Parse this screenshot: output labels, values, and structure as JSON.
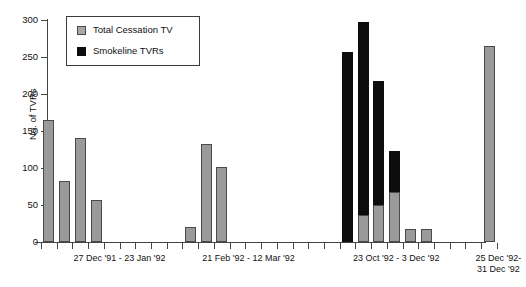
{
  "chart_data": {
    "type": "bar",
    "title": "",
    "subtitle": "",
    "xlabel": "",
    "ylabel": "No. of TVRs",
    "ylim": [
      0,
      300
    ],
    "yticks": [
      0,
      50,
      100,
      150,
      200,
      250,
      300
    ],
    "grid": false,
    "stacked": true,
    "legend_position": "top-left",
    "legend": [
      "Total Cessation TV",
      "Smokeline TVRs"
    ],
    "colors": {
      "total_cessation_tv": "#9a9a9a",
      "smokeline_tvrs": "#0d0d0d",
      "axis": "#444444",
      "background": "#ffffff"
    },
    "x_slot_count": 29,
    "x_group_labels": [
      "27 Dec '91 - 23 Jan '92",
      "21 Feb '92 - 12 Mar '92",
      "23 Oct '92 - 3 Dec '92",
      "25 Dec '92-\n31 Dec '92"
    ],
    "series": [
      {
        "name": "Total Cessation TV",
        "values": [
          165,
          82,
          141,
          57,
          0,
          0,
          0,
          0,
          0,
          20,
          133,
          101,
          0,
          0,
          0,
          0,
          0,
          0,
          0,
          0,
          37,
          50,
          67,
          18,
          17,
          0,
          0,
          0,
          265
        ]
      },
      {
        "name": "Smokeline TVRs",
        "values": [
          0,
          0,
          0,
          0,
          0,
          0,
          0,
          0,
          0,
          0,
          0,
          0,
          0,
          0,
          0,
          0,
          0,
          0,
          0,
          257,
          260,
          168,
          56,
          0,
          0,
          0,
          0,
          0,
          0
        ]
      }
    ],
    "bars": [
      {
        "slot": 0,
        "gray": 165,
        "black": 0,
        "total": 165
      },
      {
        "slot": 1,
        "gray": 82,
        "black": 0,
        "total": 82
      },
      {
        "slot": 2,
        "gray": 141,
        "black": 0,
        "total": 141
      },
      {
        "slot": 3,
        "gray": 57,
        "black": 0,
        "total": 57
      },
      {
        "slot": 9,
        "gray": 20,
        "black": 0,
        "total": 20
      },
      {
        "slot": 10,
        "gray": 133,
        "black": 0,
        "total": 133
      },
      {
        "slot": 11,
        "gray": 101,
        "black": 0,
        "total": 101
      },
      {
        "slot": 19,
        "gray": 0,
        "black": 257,
        "total": 257
      },
      {
        "slot": 20,
        "gray": 37,
        "black": 260,
        "total": 297
      },
      {
        "slot": 21,
        "gray": 50,
        "black": 168,
        "total": 218
      },
      {
        "slot": 22,
        "gray": 67,
        "black": 56,
        "total": 123
      },
      {
        "slot": 23,
        "gray": 18,
        "black": 0,
        "total": 18
      },
      {
        "slot": 24,
        "gray": 17,
        "black": 0,
        "total": 17
      },
      {
        "slot": 28,
        "gray": 265,
        "black": 0,
        "total": 265
      }
    ]
  },
  "axis": {
    "y_title": "No. of TVRs",
    "y_tick_labels": [
      "0",
      "50",
      "100",
      "150",
      "200",
      "250",
      "300"
    ]
  },
  "legend": {
    "items": [
      {
        "label": "Total Cessation TV",
        "swatch": "gray"
      },
      {
        "label": "Smokeline TVRs",
        "swatch": "black"
      }
    ]
  },
  "x_groups": [
    {
      "label": "27 Dec '91 - 23 Jan '92",
      "center_slot": 5.0
    },
    {
      "label": "21 Feb '92 - 12 Mar '92",
      "center_slot": 13.2
    },
    {
      "label": "23 Oct '92 - 3 Dec '92",
      "center_slot": 22.6
    },
    {
      "label": "25 Dec '92-\n31 Dec '92",
      "center_slot": 29.1
    }
  ]
}
